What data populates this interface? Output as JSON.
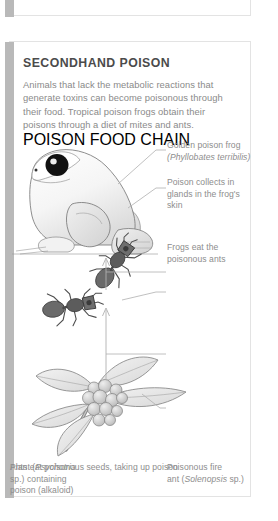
{
  "card": {
    "title": "SECONDHAND POISON",
    "body": "Animals that lack the metabolic reactions that generate toxins can become poisonous through their food. Tropical poison frogs obtain their poisons through a diet of mites and ants.",
    "footer_caption": "POISON FOOD CHAIN"
  },
  "labels": {
    "frog_name_line1": "Golden poison frog",
    "frog_name_line2": "(Phyllobates terribilis)",
    "frog_glands": "Poison collects in glands in the frog's skin",
    "frogs_eat_ants": "Frogs eat the poisonous ants",
    "ant_name_line1": "Poisonous fire",
    "ant_name_line2": "ant (Solenopsis sp.)",
    "ants_eat_seeds": "Ants eat poisonous seeds, taking up poison",
    "plant_line1": "Plant (Psychotria",
    "plant_line2": "sp.) containing",
    "plant_line3": "poison (alkaloid)"
  },
  "colors": {
    "accent_bar": "#b9b9b9",
    "card_border": "#e3e3e3",
    "title_text": "#4b4b4b",
    "body_text": "#8a8a8a",
    "label_text": "#8d8d8d",
    "illustration_outline": "#7a7a7a",
    "ant_body": "#5a5a5a",
    "leader_line": "#b0b0b0"
  },
  "illustrations": {
    "frog": "golden-poison-frog-facing-left",
    "ants": "two-fire-ants",
    "plant": "psychotria-plant-with-berry-cluster"
  }
}
